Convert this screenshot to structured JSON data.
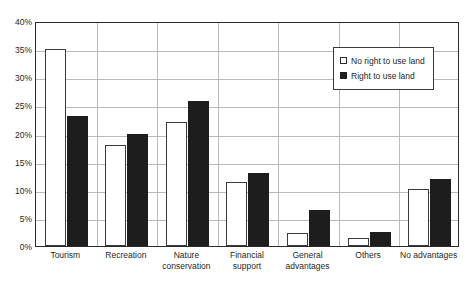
{
  "chart_data": {
    "type": "bar",
    "title": "",
    "subtitle": "",
    "xlabel": "",
    "ylabel": "",
    "ylim": [
      0,
      40
    ],
    "ytick_labels": [
      "0%",
      "5%",
      "10%",
      "15%",
      "20%",
      "25%",
      "30%",
      "35%",
      "40%"
    ],
    "ytick_values": [
      0,
      5,
      10,
      15,
      20,
      25,
      30,
      35,
      40
    ],
    "grid": "horizontal and vertical group separators",
    "legend_position": "top-right inside plot",
    "categories": [
      "Tourism",
      "Recreation",
      "Nature conservation",
      "Financial support",
      "General advantages",
      "Others",
      "No advantages"
    ],
    "series": [
      {
        "name": "No right to use land",
        "color": "#ffffff",
        "values": [
          35.0,
          18.0,
          22.0,
          11.3,
          2.4,
          1.5,
          10.2
        ]
      },
      {
        "name": "Right to use land",
        "color": "#1d1d1d",
        "values": [
          23.2,
          19.9,
          25.8,
          13.0,
          6.4,
          2.5,
          12.0
        ]
      }
    ]
  },
  "legend": {
    "items": [
      {
        "label": "No right to use land",
        "swatch": "hollow-square"
      },
      {
        "label": "Right to use land",
        "swatch": "filled-square"
      }
    ]
  }
}
